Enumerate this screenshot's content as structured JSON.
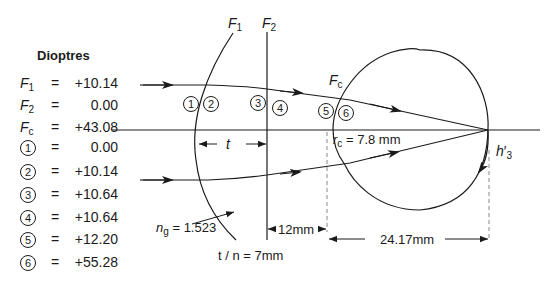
{
  "legend": {
    "title": "Dioptres",
    "rows": [
      {
        "symbol": "F",
        "subscript": "1",
        "value": "+10.14"
      },
      {
        "symbol": "F",
        "subscript": "2",
        "value": "0.00"
      },
      {
        "symbol": "F",
        "subscript": "c",
        "value": "+43.08"
      },
      {
        "circled": "1",
        "value": "0.00"
      },
      {
        "circled": "2",
        "value": "+10.14"
      },
      {
        "circled": "3",
        "value": "+10.64"
      },
      {
        "circled": "4",
        "value": "+10.64"
      },
      {
        "circled": "5",
        "value": "+12.20"
      },
      {
        "circled": "6",
        "value": "+55.28"
      }
    ],
    "equals": "="
  },
  "surfaces": {
    "f1": {
      "symbol": "F",
      "subscript": "1"
    },
    "f2": {
      "symbol": "F",
      "subscript": "2"
    },
    "fc": {
      "symbol": "F",
      "subscript": "c"
    }
  },
  "markers": [
    "1",
    "2",
    "3",
    "4",
    "5",
    "6"
  ],
  "dimensions": {
    "thickness": "t",
    "reduced_thickness": "t / n = 7mm",
    "vertex_distance": "12mm",
    "axial_length": "24.17mm",
    "corneal_radius_symbol": "r",
    "corneal_radius_sub": "c",
    "corneal_radius_value": "= 7.8 mm",
    "glass_index_symbol": "n",
    "glass_index_sub": "g",
    "glass_index_value": "= 1.523",
    "image_height_symbol": "h",
    "image_height_sub": "3",
    "image_height_prime": "′"
  },
  "colors": {
    "ink": "#1a1a1a",
    "dash": "#888888",
    "background": "#ffffff"
  }
}
